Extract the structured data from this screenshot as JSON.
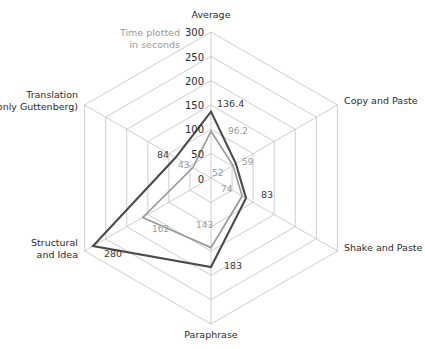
{
  "note": {
    "line1": "Time plotted",
    "line2": "in seconds"
  },
  "axis_labels": {
    "average": "Average",
    "copy_and_paste": "Copy and Paste",
    "shake_and_paste": "Shake and Paste",
    "paraphrase": "Paraphrase",
    "structural_and_idea_line1": "Structural",
    "structural_and_idea_line2": "and Idea",
    "translation_line1": "Translation",
    "translation_line2": "(only Guttenberg)"
  },
  "ticks": {
    "t0": "0",
    "t50": "50",
    "t100": "100",
    "t150": "150",
    "t200": "200",
    "t250": "250",
    "t300": "300"
  },
  "value_labels": {
    "dark": {
      "average": "136.4",
      "shake_and_paste": "83",
      "paraphrase": "183",
      "structural_and_idea": "280",
      "translation": "84"
    },
    "gray": {
      "average": "96.2",
      "copy_and_paste_outer": "59",
      "copy_and_paste_inner": "52",
      "shake_and_paste": "74",
      "paraphrase": "143",
      "structural_and_idea": "162",
      "translation": "43"
    }
  },
  "colors": {
    "series_dark": "#4a4a4a",
    "series_gray": "#9a9a9a",
    "grid": "#b9b9b9",
    "note_text": "#9b9b9b",
    "label_text": "#2b2b2b"
  },
  "chart_data": {
    "type": "radar",
    "title": "",
    "subtitle": "Time plotted in seconds",
    "unit": "seconds",
    "categories": [
      "Average",
      "Copy and Paste",
      "Shake and Paste",
      "Paraphrase",
      "Structural and Idea",
      "Translation (only Guttenberg)"
    ],
    "series": [
      {
        "name": "dark",
        "values": [
          136.4,
          59,
          83,
          183,
          280,
          84
        ]
      },
      {
        "name": "gray",
        "values": [
          96.2,
          52,
          74,
          143,
          162,
          43
        ]
      }
    ],
    "radial_axis": {
      "min": 0,
      "max": 300,
      "ticks": [
        0,
        50,
        100,
        150,
        200,
        250,
        300
      ],
      "tick_axis": "Average"
    },
    "grid": true,
    "legend": "none",
    "annotations": [
      "Time plotted in seconds"
    ]
  }
}
